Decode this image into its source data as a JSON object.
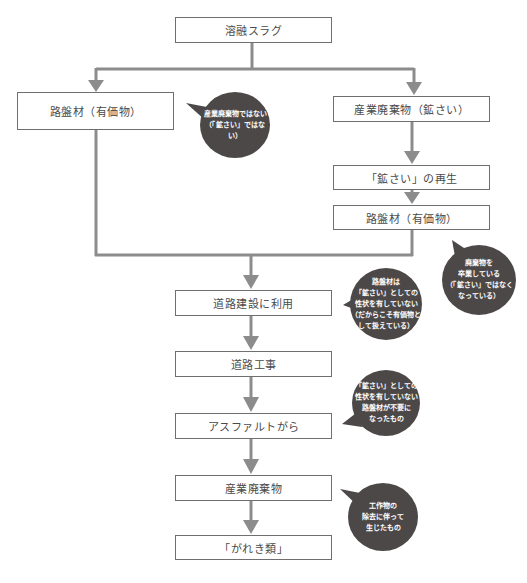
{
  "colors": {
    "connector": "#8c8c8c",
    "box_border": "#6f6f6f",
    "box_text": "#4a4a4a",
    "bubble_fill": "#4d4848",
    "bubble_text": "#ffffff"
  },
  "nodes": {
    "molten_slag": "溶融スラグ",
    "roadbed_left": "路盤材（有価物）",
    "industrial_waste_slag": "産業廃棄物（鉱さい）",
    "slag_recycling": "「鉱さい」の再生",
    "roadbed_right": "路盤材（有価物）",
    "road_construction_use": "道路建設に利用",
    "road_work": "道路工事",
    "asphalt_debris": "アスファルトがら",
    "industrial_waste": "産業廃棄物",
    "rubble": "「がれき類」"
  },
  "callouts": {
    "not_waste": "産業廃棄物ではない\n（「鉱さい」ではない）",
    "graduated_waste": "廃棄物を\n卒業している\n（「鉱さい」ではなく\nなっている）",
    "no_slag_properties": "路盤材は\n「鉱さい」としての\n性状を有していない\n（だからこそ有価物と\nして扱えている）",
    "unneeded_roadbed": "「鉱さい」としての\n性状を有していない\n路盤材が不要に\nなったもの",
    "from_removal": "工作物の\n除去に伴って\n生じたもの"
  }
}
